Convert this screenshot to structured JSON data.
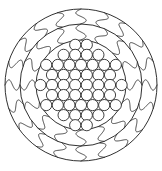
{
  "figure": {
    "background_color": "#ffffff",
    "line_color": "#1a1a1a",
    "width": 162,
    "height": 171
  },
  "chart_data": {
    "type": "diagram",
    "xlabel": "",
    "ylabel": "",
    "center": {
      "x": 81,
      "y": 85
    },
    "rings": [
      {
        "name": "outer-ring",
        "inner_radius": 61,
        "outer_radius": 76,
        "divider_count": 20,
        "divider_style": "wavy-s-curve",
        "label": "Outer ring"
      },
      {
        "name": "middle-ring",
        "inner_radius": 45,
        "outer_radius": 61,
        "divider_count": 16,
        "divider_style": "wavy-s-curve",
        "label": "Middle ring"
      },
      {
        "name": "core",
        "inner_radius": 0,
        "outer_radius": 45,
        "divider_count": 0,
        "divider_style": "circle-packing",
        "label": "Core"
      }
    ],
    "core_packing": {
      "packing_type": "hexagonal",
      "circle_radius": 5.6,
      "spacing": 11.6,
      "row_count": 9,
      "circle_count": 49,
      "row_counts": [
        4,
        6,
        7,
        8,
        8,
        8,
        7,
        6,
        4
      ]
    },
    "boundary_circles": [
      76,
      61,
      45
    ]
  }
}
